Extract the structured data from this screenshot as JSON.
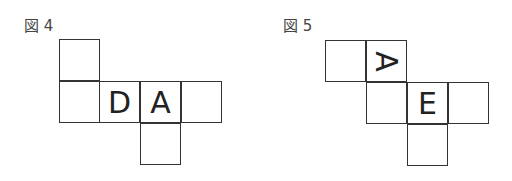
{
  "figures": [
    {
      "label": "図 4",
      "faces": {
        "d": "D",
        "a": "A"
      }
    },
    {
      "label": "図 5",
      "faces": {
        "a": "A",
        "e": "E"
      }
    }
  ]
}
